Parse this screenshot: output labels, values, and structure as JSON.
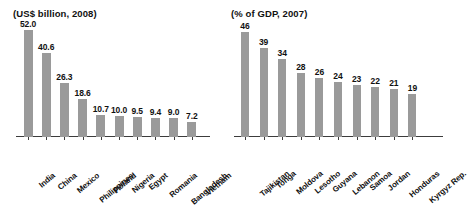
{
  "chart_data": [
    {
      "type": "bar",
      "title": "(US$ billion, 2008)",
      "xlabel": "",
      "ylabel": "",
      "ylim": [
        0,
        52
      ],
      "grid": false,
      "legend": "none",
      "categories": [
        "India",
        "China",
        "Mexico",
        "Philippines",
        "Poland",
        "Nigeria",
        "Egypt",
        "Romania",
        "Bangladesh",
        "Vietnam"
      ],
      "values": [
        52.0,
        40.6,
        26.3,
        18.6,
        10.7,
        10.0,
        9.5,
        9.4,
        9.0,
        7.2
      ],
      "value_labels": [
        "52.0",
        "40.6",
        "26.3",
        "18.6",
        "10.7",
        "10.0",
        "9.5",
        "9.4",
        "9.0",
        "7.2"
      ],
      "bar_color": "#9a9a9a"
    },
    {
      "type": "bar",
      "title": "(% of GDP, 2007)",
      "xlabel": "",
      "ylabel": "",
      "ylim": [
        0,
        46
      ],
      "grid": false,
      "legend": "none",
      "categories": [
        "Tajikistan",
        "Tonga",
        "Moldova",
        "Lesotho",
        "Guyana",
        "Lebanon",
        "Samoa",
        "Jordan",
        "Honduras",
        "Kyrgyz Rep."
      ],
      "values": [
        46,
        39,
        34,
        28,
        26,
        24,
        23,
        22,
        21,
        19
      ],
      "value_labels": [
        "46",
        "39",
        "34",
        "28",
        "26",
        "24",
        "23",
        "22",
        "21",
        "19"
      ],
      "bar_color": "#9a9a9a"
    }
  ]
}
